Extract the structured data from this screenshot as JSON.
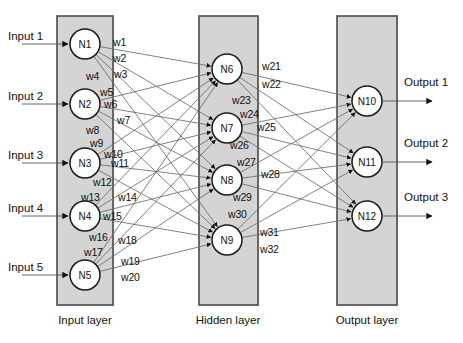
{
  "diagram": {
    "colors": {
      "layer_fill": "#d4d4d4",
      "layer_stroke": "#4a4a4a",
      "node_fill": "#ffffff",
      "node_stroke": "#1a1a1a",
      "edge_stroke": "#6b6b6b",
      "text": "#111111",
      "page_bg": "#ffffff"
    },
    "layers": [
      {
        "id": "input",
        "label": "Input layer",
        "rect": {
          "x": 57,
          "y": 16,
          "w": 56,
          "h": 289
        },
        "label_pos": {
          "x": 85,
          "y": 322
        },
        "nodes": [
          {
            "id": "N1",
            "label": "N1",
            "cx": 85,
            "cy": 44,
            "r": 15
          },
          {
            "id": "N2",
            "label": "N2",
            "cx": 85,
            "cy": 104,
            "r": 15
          },
          {
            "id": "N3",
            "label": "N3",
            "cx": 85,
            "cy": 163,
            "r": 15
          },
          {
            "id": "N4",
            "label": "N4",
            "cx": 85,
            "cy": 216,
            "r": 15
          },
          {
            "id": "N5",
            "label": "N5",
            "cx": 85,
            "cy": 275,
            "r": 15
          }
        ]
      },
      {
        "id": "hidden",
        "label": "Hidden layer",
        "rect": {
          "x": 199,
          "y": 16,
          "w": 59,
          "h": 289
        },
        "label_pos": {
          "x": 228,
          "y": 322
        },
        "nodes": [
          {
            "id": "N6",
            "label": "N6",
            "cx": 227,
            "cy": 69,
            "r": 15
          },
          {
            "id": "N7",
            "label": "N7",
            "cx": 227,
            "cy": 128,
            "r": 15
          },
          {
            "id": "N8",
            "label": "N8",
            "cx": 227,
            "cy": 180,
            "r": 15
          },
          {
            "id": "N9",
            "label": "N9",
            "cx": 227,
            "cy": 240,
            "r": 15
          }
        ]
      },
      {
        "id": "output",
        "label": "Output layer",
        "rect": {
          "x": 337,
          "y": 16,
          "w": 60,
          "h": 289
        },
        "label_pos": {
          "x": 367,
          "y": 322
        },
        "nodes": [
          {
            "id": "N10",
            "label": "N10",
            "cx": 367,
            "cy": 101,
            "r": 15
          },
          {
            "id": "N11",
            "label": "N11",
            "cx": 367,
            "cy": 162,
            "r": 15
          },
          {
            "id": "N12",
            "label": "N12",
            "cx": 367,
            "cy": 216,
            "r": 15
          }
        ]
      }
    ],
    "inputs": [
      {
        "label": "Input 1",
        "text_x": 8,
        "text_y": 38,
        "arrow_y": 44
      },
      {
        "label": "Input 2",
        "text_x": 8,
        "text_y": 98,
        "arrow_y": 104
      },
      {
        "label": "Input 3",
        "text_x": 8,
        "text_y": 157,
        "arrow_y": 163
      },
      {
        "label": "Input 4",
        "text_x": 8,
        "text_y": 210,
        "arrow_y": 216
      },
      {
        "label": "Input 5",
        "text_x": 8,
        "text_y": 269,
        "arrow_y": 275
      }
    ],
    "outputs": [
      {
        "label": "Output 1",
        "text_x": 404,
        "text_y": 88,
        "arrow_y": 101
      },
      {
        "label": "Output 2",
        "text_x": 404,
        "text_y": 149,
        "arrow_y": 162
      },
      {
        "label": "Output 3",
        "text_x": 404,
        "text_y": 203,
        "arrow_y": 216
      }
    ],
    "weight_labels": [
      {
        "name": "w1",
        "x": 113,
        "y": 36
      },
      {
        "name": "w2",
        "x": 113,
        "y": 52
      },
      {
        "name": "w3",
        "x": 114,
        "y": 68
      },
      {
        "name": "w4",
        "x": 86,
        "y": 70
      },
      {
        "name": "w5",
        "x": 100,
        "y": 86
      },
      {
        "name": "w6",
        "x": 104,
        "y": 98
      },
      {
        "name": "w7",
        "x": 117,
        "y": 114
      },
      {
        "name": "w8",
        "x": 86,
        "y": 124
      },
      {
        "name": "w9",
        "x": 90,
        "y": 137
      },
      {
        "name": "w10",
        "x": 104,
        "y": 148
      },
      {
        "name": "w11",
        "x": 111,
        "y": 157
      },
      {
        "name": "w12",
        "x": 93,
        "y": 176
      },
      {
        "name": "w13",
        "x": 81,
        "y": 191
      },
      {
        "name": "w14",
        "x": 118,
        "y": 191
      },
      {
        "name": "w15",
        "x": 103,
        "y": 210
      },
      {
        "name": "w16",
        "x": 89,
        "y": 231
      },
      {
        "name": "w17",
        "x": 84,
        "y": 246
      },
      {
        "name": "w18",
        "x": 118,
        "y": 234
      },
      {
        "name": "w19",
        "x": 121,
        "y": 255
      },
      {
        "name": "w20",
        "x": 121,
        "y": 271
      },
      {
        "name": "w21",
        "x": 262,
        "y": 60
      },
      {
        "name": "w22",
        "x": 262,
        "y": 78
      },
      {
        "name": "w23",
        "x": 232,
        "y": 94
      },
      {
        "name": "w24",
        "x": 240,
        "y": 108
      },
      {
        "name": "w25",
        "x": 257,
        "y": 121
      },
      {
        "name": "w26",
        "x": 230,
        "y": 139
      },
      {
        "name": "w27",
        "x": 237,
        "y": 156
      },
      {
        "name": "w28",
        "x": 261,
        "y": 168
      },
      {
        "name": "w29",
        "x": 233,
        "y": 191
      },
      {
        "name": "w30",
        "x": 228,
        "y": 208
      },
      {
        "name": "w31",
        "x": 260,
        "y": 226
      },
      {
        "name": "w32",
        "x": 260,
        "y": 243
      }
    ],
    "connections": {
      "input_to_hidden_count": 20,
      "hidden_to_output_count": 12,
      "fully_connected": true
    }
  }
}
